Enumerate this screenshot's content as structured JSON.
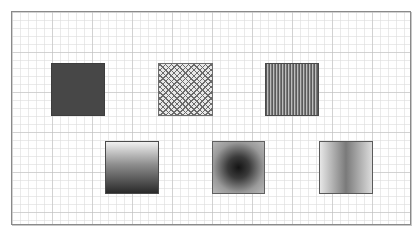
{
  "canvas": {
    "grid": {
      "major_spacing_px": 40,
      "minor_spacing_px": 8,
      "color": "#bebebe"
    },
    "border_color": "#8a8a8a",
    "background": "#ffffff"
  },
  "swatches": [
    {
      "id": "solid-fill",
      "fill_type": "solid",
      "color": "#474747"
    },
    {
      "id": "crosshatch-fill",
      "fill_type": "pattern",
      "pattern": "diagonal-crosshatch"
    },
    {
      "id": "vertical-stripes-fill",
      "fill_type": "pattern",
      "pattern": "vertical-lines"
    },
    {
      "id": "linear-gradient-vertical",
      "fill_type": "gradient",
      "gradient": "linear",
      "direction": "top-to-bottom",
      "stops": [
        "#f0f0f0",
        "#2a2a2a"
      ]
    },
    {
      "id": "radial-gradient",
      "fill_type": "gradient",
      "gradient": "radial",
      "stops": [
        "#141414",
        "#b9b9b9"
      ]
    },
    {
      "id": "linear-gradient-horizontal",
      "fill_type": "gradient",
      "gradient": "linear-reflected",
      "direction": "left-to-right",
      "stops": [
        "#e6e6e6",
        "#7a7a7a",
        "#dcdcdc"
      ]
    }
  ]
}
